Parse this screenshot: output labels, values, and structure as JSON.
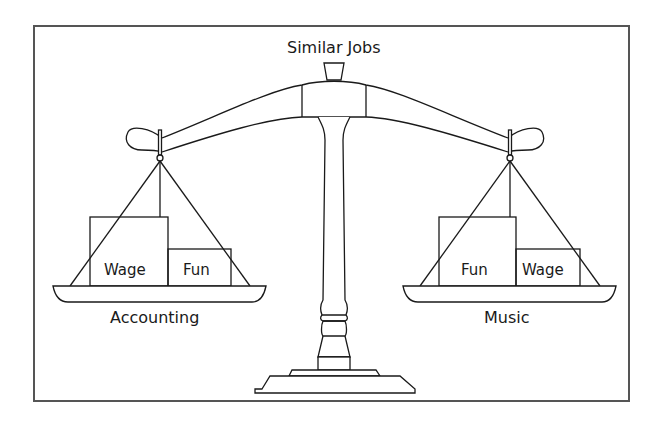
{
  "diagram": {
    "title": "Similar Jobs",
    "left_pan": {
      "label": "Accounting",
      "boxes": [
        {
          "label": "Wage",
          "size": "large"
        },
        {
          "label": "Fun",
          "size": "small"
        }
      ]
    },
    "right_pan": {
      "label": "Music",
      "boxes": [
        {
          "label": "Fun",
          "size": "large"
        },
        {
          "label": "Wage",
          "size": "small"
        }
      ]
    },
    "colors": {
      "stroke": "#1a1a1a",
      "frame": "#555555",
      "background": "#ffffff"
    }
  }
}
